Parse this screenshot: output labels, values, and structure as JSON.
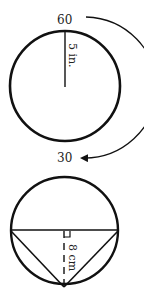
{
  "figure1": {
    "top_label": "60",
    "bottom_label": "30",
    "radius_label": "5 in."
  },
  "figure2": {
    "height_label": "8 cm"
  },
  "colors": {
    "stroke": "#111111",
    "background": "#ffffff"
  }
}
